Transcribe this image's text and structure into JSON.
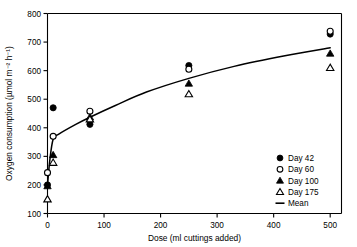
{
  "chart_data": {
    "type": "scatter",
    "title": "",
    "xlabel": "Dose (ml cuttings added)",
    "ylabel": "Oxygen consumption (µmol m⁻² h⁻¹)",
    "xlim": [
      0,
      520
    ],
    "ylim": [
      100,
      800
    ],
    "xticks": [
      0,
      100,
      200,
      300,
      400,
      500
    ],
    "yticks": [
      100,
      200,
      300,
      400,
      500,
      600,
      700,
      800
    ],
    "grid": false,
    "legend_position": "lower-right",
    "series": [
      {
        "name": "Day 42",
        "marker": "filled-circle",
        "color": "#000000",
        "points": [
          {
            "x": 0,
            "y": 200
          },
          {
            "x": 10,
            "y": 470
          },
          {
            "x": 75,
            "y": 412
          },
          {
            "x": 250,
            "y": 618
          },
          {
            "x": 500,
            "y": 728
          }
        ]
      },
      {
        "name": "Day 60",
        "marker": "open-circle",
        "color": "#000000",
        "points": [
          {
            "x": 0,
            "y": 243
          },
          {
            "x": 10,
            "y": 370
          },
          {
            "x": 75,
            "y": 458
          },
          {
            "x": 250,
            "y": 605
          },
          {
            "x": 500,
            "y": 738
          }
        ]
      },
      {
        "name": "Day 100",
        "marker": "filled-triangle",
        "color": "#000000",
        "points": [
          {
            "x": 0,
            "y": 196
          },
          {
            "x": 10,
            "y": 305
          },
          {
            "x": 75,
            "y": 437
          },
          {
            "x": 250,
            "y": 555
          },
          {
            "x": 500,
            "y": 660
          }
        ]
      },
      {
        "name": "Day 175",
        "marker": "open-triangle",
        "color": "#000000",
        "points": [
          {
            "x": 0,
            "y": 150
          },
          {
            "x": 10,
            "y": 278
          },
          {
            "x": 75,
            "y": 430
          },
          {
            "x": 250,
            "y": 518
          },
          {
            "x": 500,
            "y": 610
          }
        ]
      },
      {
        "name": "Mean",
        "marker": "line",
        "color": "#000000",
        "points": [
          {
            "x": 0,
            "y": 198
          },
          {
            "x": 4,
            "y": 285
          },
          {
            "x": 10,
            "y": 360
          },
          {
            "x": 20,
            "y": 378
          },
          {
            "x": 50,
            "y": 412
          },
          {
            "x": 75,
            "y": 437
          },
          {
            "x": 120,
            "y": 478
          },
          {
            "x": 175,
            "y": 525
          },
          {
            "x": 250,
            "y": 573
          },
          {
            "x": 330,
            "y": 615
          },
          {
            "x": 420,
            "y": 652
          },
          {
            "x": 500,
            "y": 680
          }
        ]
      }
    ]
  },
  "legend": {
    "entries": [
      {
        "label": "Day 42",
        "marker": "filled-circle"
      },
      {
        "label": "Day 60",
        "marker": "open-circle"
      },
      {
        "label": "Day 100",
        "marker": "filled-triangle"
      },
      {
        "label": "Day 175",
        "marker": "open-triangle"
      },
      {
        "label": "Mean",
        "marker": "line"
      }
    ]
  },
  "axes": {
    "x_tick_labels": [
      "0",
      "100",
      "200",
      "300",
      "400",
      "500"
    ],
    "y_tick_labels": [
      "100",
      "200",
      "300",
      "400",
      "500",
      "600",
      "700",
      "800"
    ],
    "x_title": "Dose (ml cuttings added)",
    "y_title": "Oxygen consumption (µmol m⁻² h⁻¹)"
  }
}
